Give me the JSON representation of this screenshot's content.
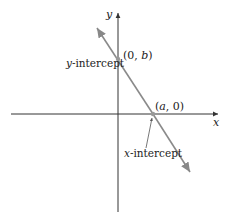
{
  "diagram": {
    "type": "line-intercepts",
    "axes": {
      "x_label": "x",
      "y_label": "y",
      "axis_color": "#333333"
    },
    "line": {
      "color": "#888888",
      "description": "Line with negative slope crossing both axes"
    },
    "points": [
      {
        "id": "y-intercept",
        "label": "(0, b)",
        "annotation": "y-intercept"
      },
      {
        "id": "x-intercept",
        "label": "(a, 0)",
        "annotation": "x-intercept"
      }
    ],
    "text": {
      "y_point_label_open": "(0, ",
      "y_point_label_var": "b",
      "y_point_label_close": ")",
      "x_point_label_open": "(",
      "x_point_label_var": "a",
      "x_point_label_close": ", 0)",
      "y_intercept_var": "y",
      "y_intercept_rest": "-intercept",
      "x_intercept_var": "x",
      "x_intercept_rest": "-intercept"
    }
  }
}
